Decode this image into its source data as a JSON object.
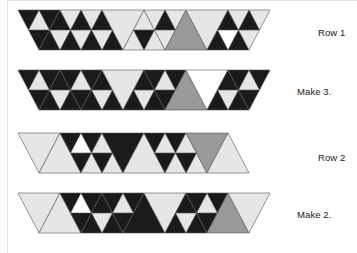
{
  "document": {
    "type": "quilt-piecing-diagram",
    "title": "Pieced triangle rows assembly diagram",
    "background_color": "#ffffff"
  },
  "palette": {
    "black": "#1a1a1a",
    "white": "#ffffff",
    "light_gray": "#e6e6e6",
    "medium_gray": "#999999",
    "outline": "#555555",
    "rule": "#e2e2e2",
    "text": "#1a1a1a"
  },
  "labels": [
    {
      "id": "row-1",
      "text": "Row 1",
      "x": 318,
      "y": 33
    },
    {
      "id": "make-3",
      "text": "Make 3.",
      "x": 297,
      "y": 92
    },
    {
      "id": "row-2",
      "text": "Row 2",
      "x": 318,
      "y": 158
    },
    {
      "id": "make-2",
      "text": "Make 2.",
      "x": 297,
      "y": 215
    }
  ],
  "rules": [
    {
      "id": "left-margin-rule",
      "x": 7,
      "y": 0,
      "w": 1,
      "h": 253
    },
    {
      "id": "top-rule",
      "x": 7,
      "y": 0,
      "w": 350,
      "h": 1
    }
  ],
  "bands": [
    {
      "id": "band-row-1",
      "label_ref": "row-1",
      "x": 18,
      "y": 10,
      "unit": 42,
      "height": 40,
      "note": "Row 1: strip of alternating up/down triangles, some subdivided.",
      "units": [
        {
          "i": 0,
          "dir": "down",
          "fill": "black",
          "sub": {
            "center": "light_gray"
          }
        },
        {
          "i": 1,
          "dir": "up",
          "fill": "black",
          "sub": {
            "center": "light_gray"
          }
        },
        {
          "i": 2,
          "dir": "down",
          "fill": "light_gray",
          "sub": {
            "center": "black"
          }
        },
        {
          "i": 3,
          "dir": "up",
          "fill": "black",
          "sub": {
            "center": "light_gray"
          }
        },
        {
          "i": 4,
          "dir": "down",
          "fill": "light_gray",
          "sub": {
            "center": "none"
          }
        },
        {
          "i": 5,
          "dir": "up",
          "fill": "light_gray",
          "sub": {
            "center": "black"
          }
        },
        {
          "i": 6,
          "dir": "down",
          "fill": "light_gray",
          "sub": {
            "center": "black"
          }
        },
        {
          "i": 7,
          "dir": "up",
          "fill": "medium_gray",
          "sub": {
            "center": "none"
          }
        },
        {
          "i": 8,
          "dir": "down",
          "fill": "light_gray",
          "sub": {
            "center": "none"
          }
        },
        {
          "i": 9,
          "dir": "up",
          "fill": "black",
          "sub": {
            "center": "white"
          }
        },
        {
          "i": 10,
          "dir": "down",
          "fill": "light_gray",
          "sub": {
            "center": "black"
          }
        }
      ]
    },
    {
      "id": "band-make-3",
      "label_ref": "make-3",
      "x": 18,
      "y": 70,
      "unit": 42,
      "height": 40,
      "note": "Make 3: assembled Row 1 strip, sewn together.",
      "units": [
        {
          "i": 0,
          "dir": "down",
          "fill": "black",
          "sub": {
            "center": "light_gray"
          }
        },
        {
          "i": 1,
          "dir": "up",
          "fill": "black",
          "sub": {
            "center": "light_gray"
          }
        },
        {
          "i": 2,
          "dir": "down",
          "fill": "black",
          "sub": {
            "center": "light_gray"
          }
        },
        {
          "i": 3,
          "dir": "up",
          "fill": "black",
          "sub": {
            "center": "light_gray"
          }
        },
        {
          "i": 4,
          "dir": "down",
          "fill": "light_gray",
          "sub": {
            "center": "none"
          }
        },
        {
          "i": 5,
          "dir": "up",
          "fill": "black",
          "sub": {
            "center": "light_gray"
          }
        },
        {
          "i": 6,
          "dir": "down",
          "fill": "black",
          "sub": {
            "center": "light_gray"
          }
        },
        {
          "i": 7,
          "dir": "up",
          "fill": "medium_gray",
          "sub": {
            "center": "none"
          }
        },
        {
          "i": 8,
          "dir": "down",
          "fill": "white",
          "sub": {
            "center": "none"
          }
        },
        {
          "i": 9,
          "dir": "up",
          "fill": "black",
          "sub": {
            "center": "light_gray"
          }
        },
        {
          "i": 10,
          "dir": "down",
          "fill": "black",
          "sub": {
            "center": "light_gray"
          }
        }
      ]
    },
    {
      "id": "band-row-2",
      "label_ref": "row-2",
      "x": 18,
      "y": 133,
      "unit": 42,
      "height": 40,
      "note": "Row 2: strip of alternating up/down triangles, some subdivided.",
      "units": [
        {
          "i": 0,
          "dir": "down",
          "fill": "light_gray",
          "sub": {
            "center": "none"
          }
        },
        {
          "i": 1,
          "dir": "up",
          "fill": "light_gray",
          "sub": {
            "center": "none"
          }
        },
        {
          "i": 2,
          "dir": "down",
          "fill": "black",
          "sub": {
            "center": "white"
          }
        },
        {
          "i": 3,
          "dir": "up",
          "fill": "light_gray",
          "sub": {
            "center": "black"
          }
        },
        {
          "i": 4,
          "dir": "down",
          "fill": "black",
          "sub": {
            "center": "none"
          }
        },
        {
          "i": 5,
          "dir": "up",
          "fill": "light_gray",
          "sub": {
            "center": "none"
          }
        },
        {
          "i": 6,
          "dir": "down",
          "fill": "black",
          "sub": {
            "center": "light_gray"
          }
        },
        {
          "i": 7,
          "dir": "up",
          "fill": "light_gray",
          "sub": {
            "center": "black"
          }
        },
        {
          "i": 8,
          "dir": "down",
          "fill": "medium_gray",
          "sub": {
            "center": "none"
          }
        },
        {
          "i": 9,
          "dir": "up",
          "fill": "light_gray",
          "sub": {
            "center": "none"
          }
        }
      ]
    },
    {
      "id": "band-make-2",
      "label_ref": "make-2",
      "x": 18,
      "y": 193,
      "unit": 42,
      "height": 40,
      "note": "Make 2: assembled Row 2 strip, sewn together.",
      "units": [
        {
          "i": 0,
          "dir": "down",
          "fill": "light_gray",
          "sub": {
            "center": "none"
          }
        },
        {
          "i": 1,
          "dir": "up",
          "fill": "light_gray",
          "sub": {
            "center": "none"
          }
        },
        {
          "i": 2,
          "dir": "down",
          "fill": "black",
          "sub": {
            "center": "white"
          }
        },
        {
          "i": 3,
          "dir": "up",
          "fill": "black",
          "sub": {
            "center": "light_gray"
          }
        },
        {
          "i": 4,
          "dir": "down",
          "fill": "black",
          "sub": {
            "center": "light_gray"
          }
        },
        {
          "i": 5,
          "dir": "up",
          "fill": "black",
          "sub": {
            "center": "none"
          }
        },
        {
          "i": 6,
          "dir": "down",
          "fill": "light_gray",
          "sub": {
            "center": "none"
          }
        },
        {
          "i": 7,
          "dir": "up",
          "fill": "black",
          "sub": {
            "center": "light_gray"
          }
        },
        {
          "i": 8,
          "dir": "down",
          "fill": "black",
          "sub": {
            "center": "light_gray"
          }
        },
        {
          "i": 9,
          "dir": "up",
          "fill": "medium_gray",
          "sub": {
            "center": "none"
          }
        },
        {
          "i": 10,
          "dir": "down",
          "fill": "light_gray",
          "sub": {
            "center": "none"
          }
        }
      ]
    }
  ]
}
